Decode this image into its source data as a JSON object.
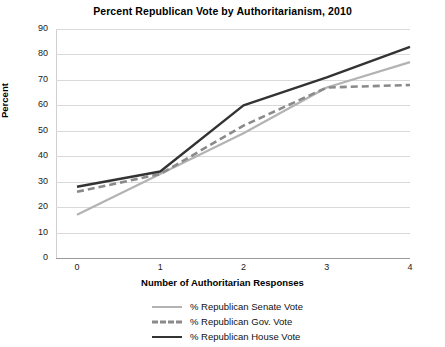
{
  "chart_data": {
    "type": "line",
    "title": "Percent Republican Vote by Authoritarianism, 2010",
    "xlabel": "Number of Authoritarian Responses",
    "ylabel": "Percent",
    "x": [
      0,
      1,
      2,
      3,
      4
    ],
    "xticklabels": [
      "0",
      "1",
      "2",
      "3",
      "4"
    ],
    "yticklabels": [
      "0",
      "10",
      "20",
      "30",
      "40",
      "50",
      "60",
      "70",
      "80",
      "90"
    ],
    "ylim": [
      0,
      90
    ],
    "ytick_step": 10,
    "xlim": [
      0,
      4
    ],
    "grid": "horizontal",
    "legend_position": "bottom",
    "series": [
      {
        "name": "% Republican Senate Vote",
        "values": [
          17,
          33,
          49,
          67,
          77
        ],
        "color": "#b3b3b3",
        "style": "solid",
        "width": 2.2
      },
      {
        "name": "% Republican Gov. Vote",
        "values": [
          26,
          33,
          52,
          67,
          68
        ],
        "color": "#8a8a8a",
        "style": "dashed",
        "width": 2.6
      },
      {
        "name": "% Republican House Vote",
        "values": [
          28,
          34,
          60,
          71,
          83
        ],
        "color": "#333333",
        "style": "solid",
        "width": 2.4
      }
    ]
  },
  "legend": {
    "items": [
      {
        "label": "% Republican Senate Vote"
      },
      {
        "label": "% Republican Gov. Vote"
      },
      {
        "label": "% Republican House Vote"
      }
    ]
  },
  "colors": {
    "background": "#ffffff",
    "grid": "#d9d9d9",
    "axis": "#9a9a9a",
    "text": "#000000"
  }
}
